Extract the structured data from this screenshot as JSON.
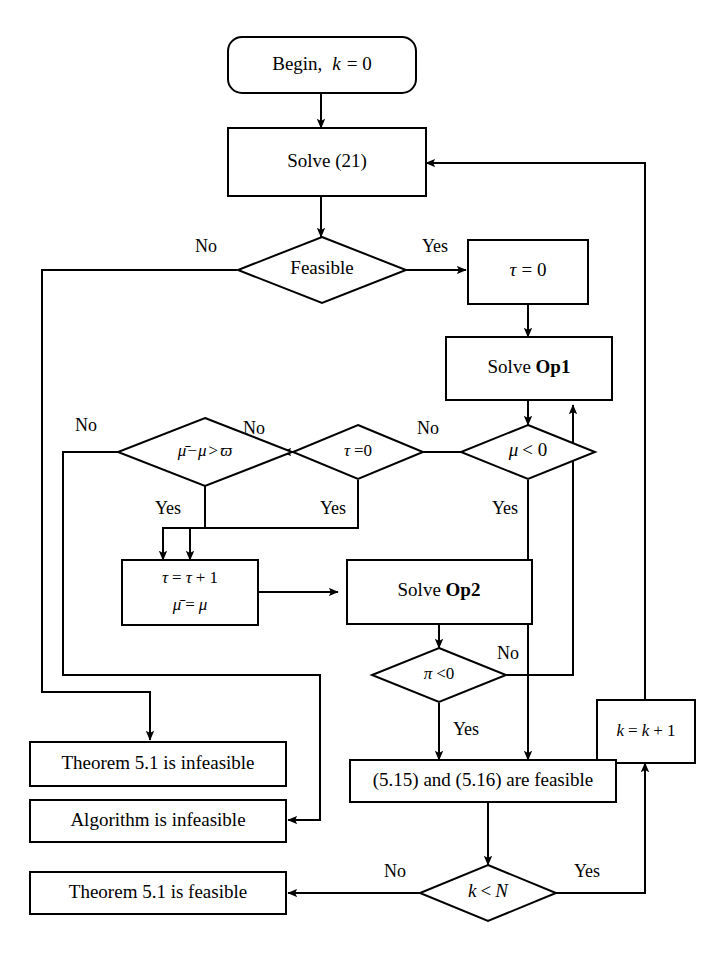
{
  "diagram": {
    "colors": {
      "stroke": "#000000",
      "fill": "#ffffff",
      "text": "#000000"
    },
    "nodes": {
      "begin": {
        "shape": "rounded-rect",
        "text": "Begin,  k = 0"
      },
      "solve21": {
        "shape": "rect",
        "text": "Solve (21)"
      },
      "feasible": {
        "shape": "diamond",
        "text": "Feasible"
      },
      "tau_zero_assign": {
        "shape": "rect",
        "text": "τ = 0"
      },
      "solve_op1": {
        "shape": "rect",
        "text": "Solve Op1",
        "plain": "Solve ",
        "bold": "Op1"
      },
      "mu_lt_zero": {
        "shape": "diamond",
        "text": "μ < 0"
      },
      "tau_eq_zero": {
        "shape": "diamond",
        "text": "τ = 0"
      },
      "mubar_minus_mu": {
        "shape": "diamond",
        "text": "μ̄ − μ > ϖ"
      },
      "tau_increment": {
        "shape": "rect",
        "line1": "τ = τ + 1",
        "line2": "μ̄ = μ"
      },
      "solve_op2": {
        "shape": "rect",
        "text": "Solve Op2",
        "plain": "Solve ",
        "bold": "Op2"
      },
      "pi_lt_zero": {
        "shape": "diamond",
        "text": "π < 0"
      },
      "k_increment": {
        "shape": "rect",
        "text": "k = k + 1"
      },
      "feasible_515_516": {
        "shape": "rect",
        "text": "(5.15) and (5.16) are feasible"
      },
      "k_lt_n": {
        "shape": "diamond",
        "text": "k < N"
      },
      "theorem_infeasible": {
        "shape": "rect",
        "text": "Theorem 5.1 is infeasible"
      },
      "algorithm_infeasible": {
        "shape": "rect",
        "text": "Algorithm is infeasible"
      },
      "theorem_feasible": {
        "shape": "rect",
        "text": "Theorem 5.1 is feasible"
      }
    },
    "edge_labels": {
      "feasible_no": "No",
      "feasible_yes": "Yes",
      "mu_lt_zero_no": "No",
      "mu_lt_zero_yes": "Yes",
      "tau_eq_zero_no": "No",
      "tau_eq_zero_yes": "Yes",
      "mubar_no": "No",
      "mubar_yes": "Yes",
      "pi_no": "No",
      "pi_yes": "Yes",
      "k_lt_n_no": "No",
      "k_lt_n_yes": "Yes"
    }
  }
}
